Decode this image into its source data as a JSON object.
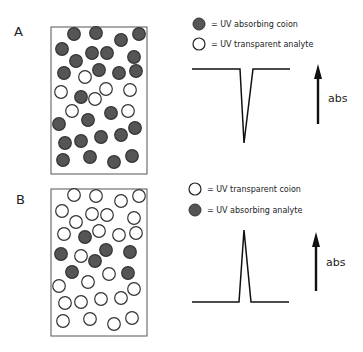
{
  "panels": [
    {
      "label": "A",
      "legend": [
        {
          "icon": "filled-circle-icon",
          "text": "= UV absorbing coion"
        },
        {
          "icon": "open-circle-icon",
          "text": "= UV transparent analyte"
        }
      ],
      "trace": "negative-peak",
      "axis_label": "abs"
    },
    {
      "label": "B",
      "legend": [
        {
          "icon": "open-circle-icon",
          "text": "= UV transparent coion"
        },
        {
          "icon": "filled-circle-icon",
          "text": "= UV absorbing analyte"
        }
      ],
      "trace": "positive-peak",
      "axis_label": "abs"
    }
  ],
  "colors": {
    "filled": "#555555",
    "stroke": "#222222"
  }
}
